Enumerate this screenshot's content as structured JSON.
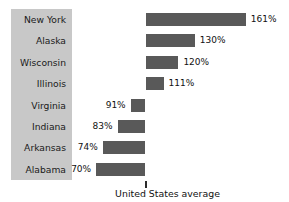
{
  "chart_data": {
    "type": "bar",
    "orientation": "horizontal",
    "title": "",
    "xlabel": "",
    "ylabel": "",
    "baseline": 100,
    "baseline_caption": "United States average",
    "value_suffix": "%",
    "categories": [
      "New York",
      "Alaska",
      "Wisconsin",
      "Illinois",
      "Virginia",
      "Indiana",
      "Arkansas",
      "Alabama"
    ],
    "values": [
      161,
      130,
      120,
      111,
      91,
      83,
      74,
      70
    ],
    "value_labels": [
      "161%",
      "130%",
      "120%",
      "111%",
      "91%",
      "83%",
      "74%",
      "70%"
    ],
    "grid": false,
    "legend": null,
    "colors": {
      "bar": "#595959",
      "label_panel": "#c8c8c8",
      "text": "#1a1a1a",
      "background": "#ffffff"
    }
  },
  "rows": [
    {
      "state": "New York",
      "label": "161%",
      "value": 161
    },
    {
      "state": "Alaska",
      "label": "130%",
      "value": 130
    },
    {
      "state": "Wisconsin",
      "label": "120%",
      "value": 120
    },
    {
      "state": "Illinois",
      "label": "111%",
      "value": 111
    },
    {
      "state": "Virginia",
      "label": "91%",
      "value": 91
    },
    {
      "state": "Indiana",
      "label": "83%",
      "value": 83
    },
    {
      "state": "Arkansas",
      "label": "74%",
      "value": 74
    },
    {
      "state": "Alabama",
      "label": "70%",
      "value": 70
    }
  ],
  "axis": {
    "baseline_caption": "United States average"
  }
}
